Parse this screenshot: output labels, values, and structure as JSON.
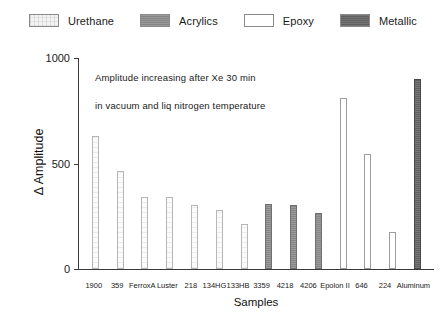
{
  "legend": {
    "position": "top-center",
    "items": [
      {
        "label": "Urethane",
        "swatch": "urethane",
        "color": "#f4f4f4"
      },
      {
        "label": "Acrylics",
        "swatch": "acrylics",
        "color": "#8d8d8d"
      },
      {
        "label": "Epoxy",
        "swatch": "epoxy",
        "color": "#ffffff"
      },
      {
        "label": "Metallic",
        "swatch": "metallic",
        "color": "#6a6a6a"
      }
    ]
  },
  "annotations": [
    "Amplitude increasing after Xe 30 min",
    "in vacuum and liq nitrogen temperature"
  ],
  "axes": {
    "y_title": "Δ Amplitude",
    "x_title": "Samples",
    "y_ticks": [
      "0",
      "500",
      "1000"
    ]
  },
  "chart_data": {
    "type": "bar",
    "title": "",
    "subtitle": "",
    "xlabel": "Samples",
    "ylabel": "Δ Amplitude",
    "ylim": [
      0,
      1000
    ],
    "yticks": [
      0,
      500,
      1000
    ],
    "grid": false,
    "legend_position": "top-center",
    "annotations": [
      "Amplitude increasing after Xe 30 min",
      "in vacuum and liq nitrogen temperature"
    ],
    "categories": [
      "1900",
      "359",
      "FerroxA",
      "Luster",
      "218",
      "134HG",
      "133HB",
      "3359",
      "4218",
      "4206",
      "Epolon II",
      "646",
      "224",
      "Aluminum"
    ],
    "values": [
      630,
      465,
      340,
      340,
      305,
      280,
      215,
      310,
      305,
      265,
      810,
      545,
      175,
      900
    ],
    "groups": [
      "Urethane",
      "Urethane",
      "Urethane",
      "Urethane",
      "Urethane",
      "Urethane",
      "Urethane",
      "Acrylics",
      "Acrylics",
      "Acrylics",
      "Epoxy",
      "Epoxy",
      "Epoxy",
      "Metallic"
    ],
    "bars": [
      {
        "category": "1900",
        "value": 630,
        "group": "Urethane"
      },
      {
        "category": "359",
        "value": 465,
        "group": "Urethane"
      },
      {
        "category": "FerroxA",
        "value": 340,
        "group": "Urethane"
      },
      {
        "category": "Luster",
        "value": 340,
        "group": "Urethane"
      },
      {
        "category": "218",
        "value": 305,
        "group": "Urethane"
      },
      {
        "category": "134HG",
        "value": 280,
        "group": "Urethane"
      },
      {
        "category": "133HB",
        "value": 215,
        "group": "Urethane"
      },
      {
        "category": "3359",
        "value": 310,
        "group": "Acrylics"
      },
      {
        "category": "4218",
        "value": 305,
        "group": "Acrylics"
      },
      {
        "category": "4206",
        "value": 265,
        "group": "Acrylics"
      },
      {
        "category": "Epolon II",
        "value": 810,
        "group": "Epoxy"
      },
      {
        "category": "646",
        "value": 545,
        "group": "Epoxy"
      },
      {
        "category": "224",
        "value": 175,
        "group": "Epoxy"
      },
      {
        "category": "Aluminum",
        "value": 900,
        "group": "Metallic"
      }
    ]
  }
}
